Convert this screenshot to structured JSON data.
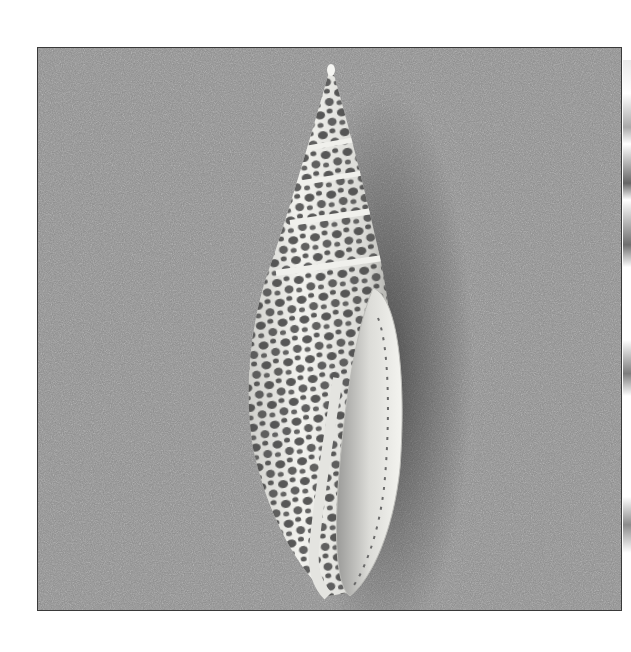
{
  "image": {
    "subject": "spotted spindle-shaped sea shell on sand",
    "alt": "Photograph of a tall conical sea shell with a dark reticulated spot pattern lying on grey sand",
    "colors": {
      "page_background": "#ffffff",
      "sand": "#8f8f8f",
      "shell_light": "#e8e8e4",
      "shell_spots": "#4a4a4a",
      "frame_border": "#3a3a3a",
      "shadow": "#3c3c3c"
    }
  }
}
